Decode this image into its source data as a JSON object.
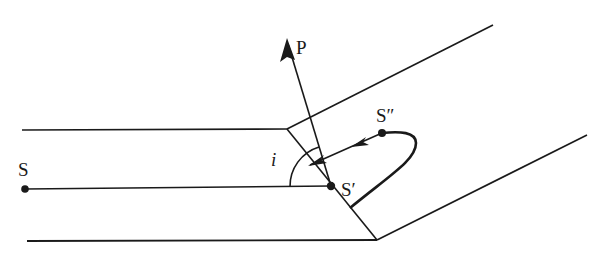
{
  "diagram": {
    "type": "refraction-of-seismic-ray-at-bend",
    "colors": {
      "stroke": "#1a1a1a",
      "background": "#ffffff"
    },
    "labels": {
      "source": "S",
      "image_point_1": "S′",
      "image_point_2": "S″",
      "normal_vector": "P",
      "angle": "i"
    },
    "points": {
      "S": {
        "x": 25,
        "y": 189
      },
      "S1": {
        "x": 331,
        "y": 186
      },
      "S2": {
        "x": 382,
        "y": 133
      },
      "P_tip": {
        "x": 287,
        "y": 40
      }
    },
    "boundaries": {
      "top_left": [
        [
          22,
          130
        ],
        [
          287,
          129
        ]
      ],
      "bottom_left": [
        [
          27,
          241
        ],
        [
          377,
          240
        ]
      ],
      "interface": [
        [
          287,
          129
        ],
        [
          377,
          240
        ]
      ],
      "top_right": [
        [
          287,
          129
        ],
        [
          493,
          25
        ]
      ],
      "bottom_right": [
        [
          377,
          240
        ],
        [
          587,
          135
        ]
      ]
    }
  }
}
